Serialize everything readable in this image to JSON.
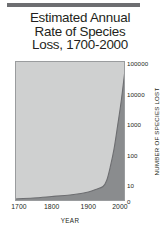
{
  "chart_data": {
    "type": "area",
    "title": "Estimated Annual Rate of Species Loss, 1700-2000",
    "title_lines": [
      "Estimated Annual",
      "Rate of Species",
      "Loss, 1700-2000"
    ],
    "xlabel": "YEAR",
    "ylabel": "NUMBER OF SPECIES LOST",
    "x_tick_labels": [
      "1700",
      "1800",
      "1900",
      "2000"
    ],
    "x_tick_values": [
      1700,
      1800,
      1900,
      2000
    ],
    "xlim": [
      1700,
      2000
    ],
    "y_tick_labels": [
      "100000",
      "10000",
      "1000",
      "100",
      "10",
      "0"
    ],
    "y_tick_values": [
      100000,
      10000,
      1000,
      100,
      10,
      0
    ],
    "y_scale": "log",
    "ylim": [
      0,
      100000
    ],
    "grid": false,
    "legend": null,
    "series": [
      {
        "name": "Number of species lost per year",
        "x": [
          1700,
          1750,
          1800,
          1850,
          1880,
          1900,
          1920,
          1940,
          1950,
          1960,
          1970,
          1980,
          1990,
          2000
        ],
        "values": [
          0.4,
          0.5,
          0.7,
          1.0,
          1.4,
          2.0,
          3.5,
          7,
          14,
          40,
          150,
          900,
          6000,
          60000
        ]
      }
    ],
    "colors": {
      "plot_background": "#cfd0d0",
      "area_fill": "#8a8c8e",
      "curve_line": "#6d6e71",
      "plot_border": "#9a9c9e",
      "text": "#231f20",
      "top_rule": "#6d6e71",
      "page_background": "#ffffff"
    }
  }
}
